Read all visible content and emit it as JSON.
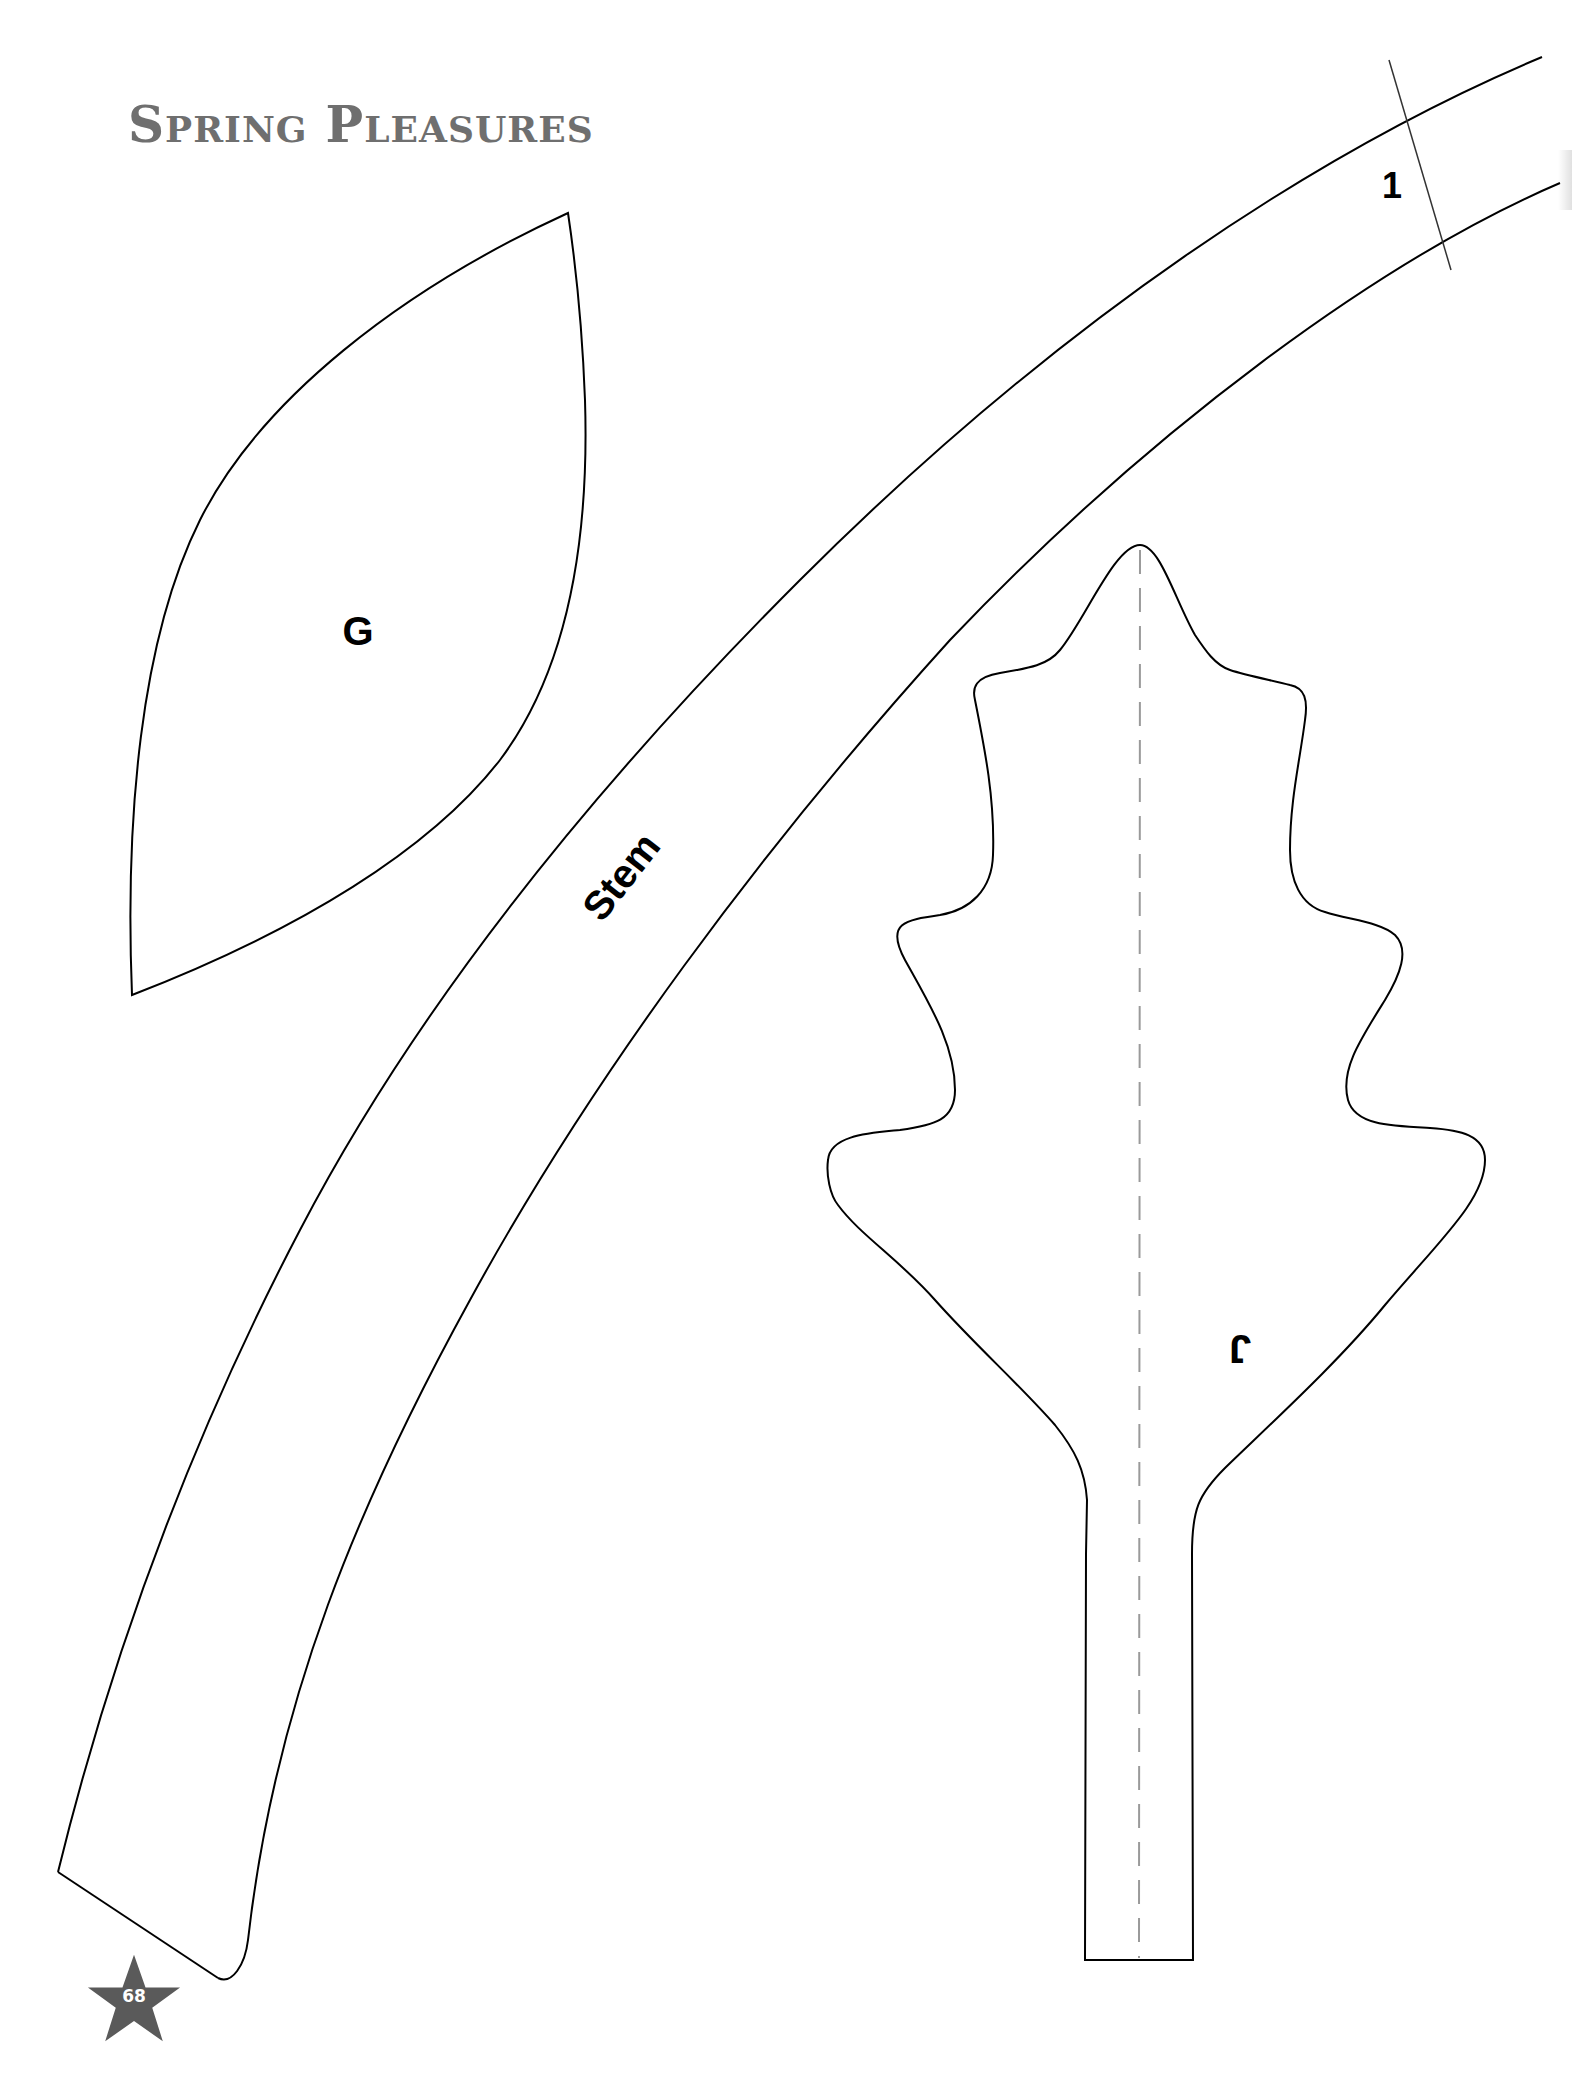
{
  "header": {
    "title_parts": {
      "s_cap": "S",
      "s_rest": "PRING",
      "p_cap": "P",
      "p_rest": "LEASURES"
    },
    "color": "#6f6f6f"
  },
  "pattern_pieces": [
    {
      "id": "G",
      "label": "G",
      "type": "petal"
    },
    {
      "id": "stem",
      "label": "Stem",
      "type": "stem",
      "join_mark_label": "1"
    },
    {
      "id": "J",
      "label": "J",
      "type": "leaf",
      "label_rotation_deg": 180,
      "fold_line": "dashed"
    }
  ],
  "page_badge": {
    "number": "68",
    "shape": "star-icon",
    "color": "#5a5a5a"
  },
  "colors": {
    "outline": "#000000",
    "fold_line": "#9a9a9a",
    "background": "#ffffff"
  }
}
